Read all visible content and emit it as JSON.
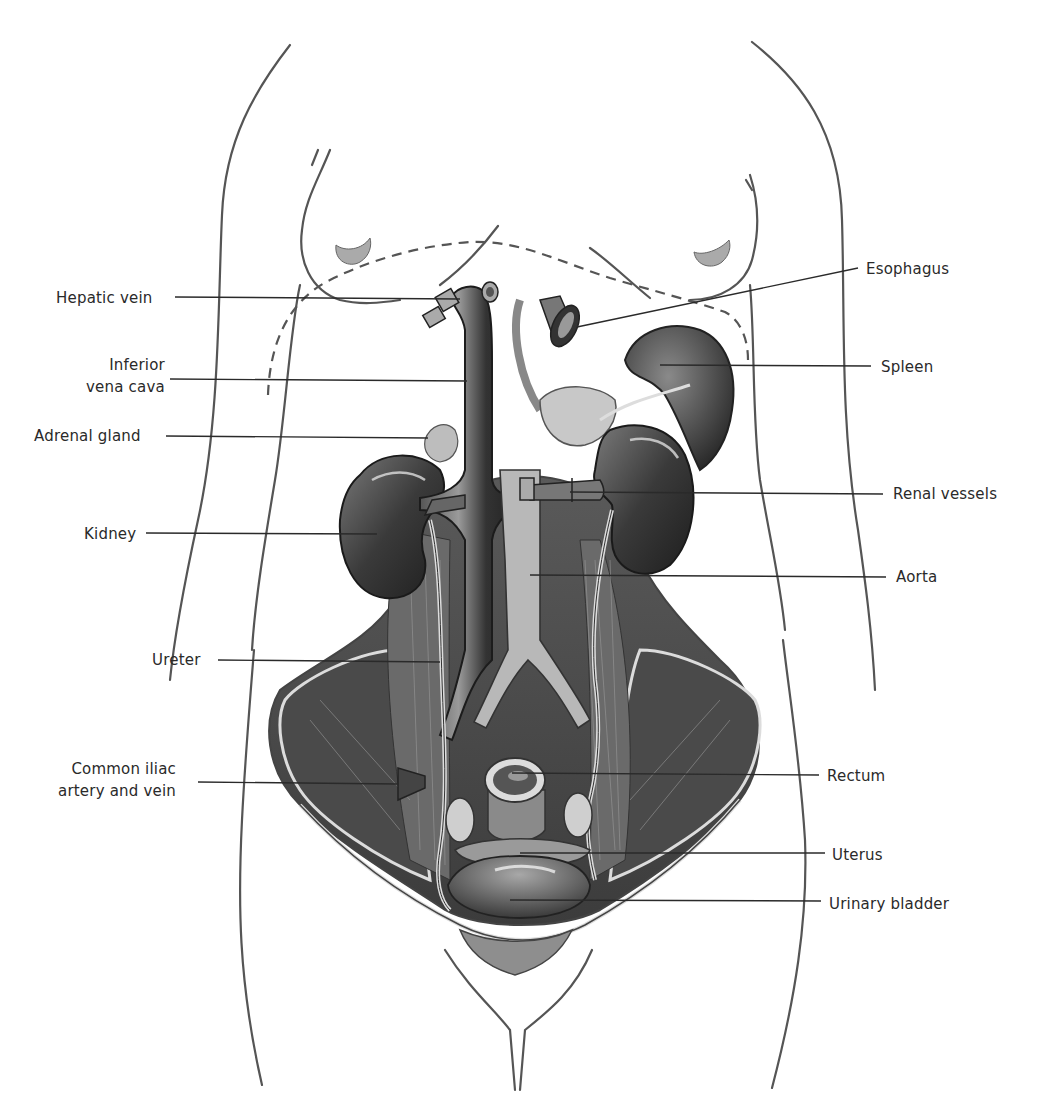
{
  "figure": {
    "colors": {
      "outline": "#555555",
      "leader": "#2a2a2a",
      "organ_dark": "#2b2b2b",
      "organ_mid": "#6e6e6e",
      "organ_light": "#bdbdbd",
      "background": "#ffffff"
    }
  },
  "labels": {
    "left": [
      {
        "id": "hepatic-vein",
        "lines": [
          "Hepatic vein"
        ],
        "x": 56,
        "y": 287,
        "lx1": 175,
        "ly": 297,
        "lx2": 460,
        "ly2": 299
      },
      {
        "id": "inferior-vena-cava",
        "lines": [
          "Inferior",
          "vena cava"
        ],
        "x": 86,
        "y": 354,
        "lx1": 170,
        "ly": 379,
        "lx2": 467,
        "ly2": 381
      },
      {
        "id": "adrenal-gland",
        "lines": [
          "Adrenal gland"
        ],
        "x": 34,
        "y": 425,
        "lx1": 166,
        "ly": 436,
        "lx2": 428,
        "ly2": 438
      },
      {
        "id": "kidney",
        "lines": [
          "Kidney"
        ],
        "x": 84,
        "y": 523,
        "lx1": 146,
        "ly": 533,
        "lx2": 377,
        "ly2": 534
      },
      {
        "id": "ureter",
        "lines": [
          "Ureter"
        ],
        "x": 152,
        "y": 649,
        "lx1": 218,
        "ly": 660,
        "lx2": 440,
        "ly2": 662
      },
      {
        "id": "common-iliac",
        "lines": [
          "Common iliac",
          "artery and vein"
        ],
        "x": 58,
        "y": 758,
        "lx1": 198,
        "ly": 782,
        "lx2": 398,
        "ly2": 784
      }
    ],
    "right": [
      {
        "id": "esophagus",
        "lines": [
          "Esophagus"
        ],
        "x": 866,
        "y": 258,
        "lx1": 858,
        "ly": 268,
        "lx2": 577,
        "ly2": 327
      },
      {
        "id": "spleen",
        "lines": [
          "Spleen"
        ],
        "x": 881,
        "y": 356,
        "lx1": 871,
        "ly": 366,
        "lx2": 660,
        "ly2": 365
      },
      {
        "id": "renal-vessels",
        "lines": [
          "Renal vessels"
        ],
        "x": 893,
        "y": 483,
        "lx1": 883,
        "ly": 494,
        "lx2": 570,
        "ly2": 492
      },
      {
        "id": "aorta",
        "lines": [
          "Aorta"
        ],
        "x": 896,
        "y": 566,
        "lx1": 886,
        "ly": 577,
        "lx2": 530,
        "ly2": 575
      },
      {
        "id": "rectum",
        "lines": [
          "Rectum"
        ],
        "x": 827,
        "y": 765,
        "lx1": 819,
        "ly": 775,
        "lx2": 512,
        "ly2": 773
      },
      {
        "id": "uterus",
        "lines": [
          "Uterus"
        ],
        "x": 832,
        "y": 844,
        "lx1": 825,
        "ly": 853,
        "lx2": 520,
        "ly2": 853
      },
      {
        "id": "urinary-bladder",
        "lines": [
          "Urinary bladder"
        ],
        "x": 829,
        "y": 893,
        "lx1": 821,
        "ly": 901,
        "lx2": 510,
        "ly2": 900
      }
    ]
  }
}
